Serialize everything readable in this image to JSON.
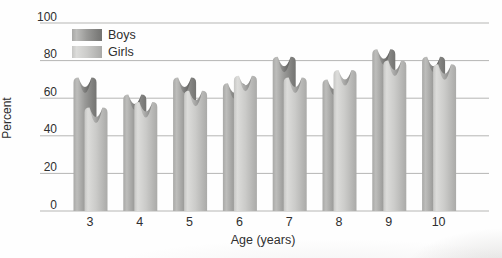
{
  "figure": {
    "ylabel": "Percent",
    "xlabel": "Age (years)"
  },
  "chart_data": {
    "type": "bar",
    "title": "",
    "xlabel": "Age (years)",
    "ylabel": "Percent",
    "categories": [
      "3",
      "4",
      "5",
      "6",
      "7",
      "8",
      "9",
      "10"
    ],
    "series": [
      {
        "name": "Boys",
        "values": [
          71,
          62,
          71,
          68,
          82,
          70,
          86,
          82
        ],
        "gradient": [
          "#a8a8a6",
          "#bdbdbb",
          "#999997",
          "#7e7e7c",
          "#747472"
        ]
      },
      {
        "name": "Girls",
        "values": [
          55,
          58,
          64,
          72,
          71,
          75,
          80,
          78
        ],
        "gradient": [
          "#c6c6c4",
          "#dcdcda",
          "#cbcbc9",
          "#b4b4b2",
          "#aaaaa8"
        ]
      }
    ],
    "ylim": [
      0,
      100
    ],
    "yticks": [
      0,
      20,
      40,
      60,
      80,
      100
    ],
    "grid": true,
    "legend_position": "top-left",
    "gridline_color": "#b6b6b4",
    "text_color": "#2f2f2f"
  }
}
